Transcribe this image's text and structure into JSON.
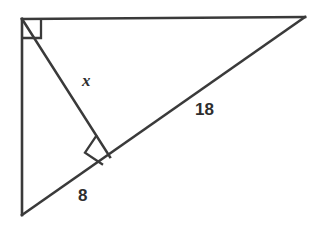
{
  "figure": {
    "kind": "geometry-diagram",
    "background_color": "#ffffff",
    "stroke_color": "#3a3a3a",
    "label_color": "#2e2e2e",
    "canvas": {
      "width": 316,
      "height": 229
    },
    "vertices": {
      "top_left": {
        "x": 22,
        "y": 19
      },
      "right": {
        "x": 305,
        "y": 17
      },
      "bottom_left": {
        "x": 22,
        "y": 215
      },
      "altitude_foot": {
        "x": 110,
        "y": 157
      }
    },
    "edges": [
      {
        "name": "top-edge",
        "from": "top_left",
        "to": "right"
      },
      {
        "name": "left-edge",
        "from": "top_left",
        "to": "bottom_left"
      },
      {
        "name": "hypotenuse",
        "from": "bottom_left",
        "to": "right"
      },
      {
        "name": "altitude",
        "from": "top_left",
        "to": "altitude_foot"
      }
    ],
    "right_angle_marks": [
      {
        "name": "vertex-right-angle",
        "at": "top_left",
        "size": 18
      },
      {
        "name": "altitude-right-angle",
        "at": "altitude_foot",
        "size": 17
      }
    ],
    "labels": {
      "altitude": "x",
      "lower_segment": "8",
      "upper_segment": "18"
    },
    "label_positions": {
      "altitude": {
        "x": 82,
        "y": 86
      },
      "lower_segment": {
        "x": 78,
        "y": 201
      },
      "upper_segment": {
        "x": 195,
        "y": 115
      }
    }
  }
}
